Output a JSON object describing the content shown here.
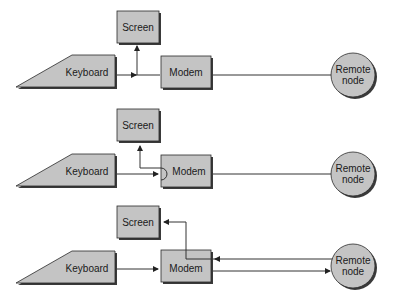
{
  "diagram": {
    "colors": {
      "node_fill": "#c4c4c4",
      "stroke": "#2a2a2a",
      "wire": "#333333"
    },
    "panels": [
      {
        "id": "panel-1",
        "nodes": {
          "screen": "Screen",
          "keyboard": "Keyboard",
          "modem": "Modem",
          "remote_line1": "Remote",
          "remote_line2": "node"
        },
        "mode": "local echo: keyboard feeds screen and modem; modem to remote node undirected line"
      },
      {
        "id": "panel-2",
        "nodes": {
          "screen": "Screen",
          "keyboard": "Keyboard",
          "modem": "Modem",
          "remote_line1": "Remote",
          "remote_line2": "node"
        },
        "mode": "modem loops keyboard input back to screen; modem to remote node undirected line"
      },
      {
        "id": "panel-3",
        "nodes": {
          "screen": "Screen",
          "keyboard": "Keyboard",
          "modem": "Modem",
          "remote_line1": "Remote",
          "remote_line2": "node"
        },
        "mode": "remote echo: keyboard to modem to remote node, remote node back through modem to screen"
      }
    ]
  }
}
